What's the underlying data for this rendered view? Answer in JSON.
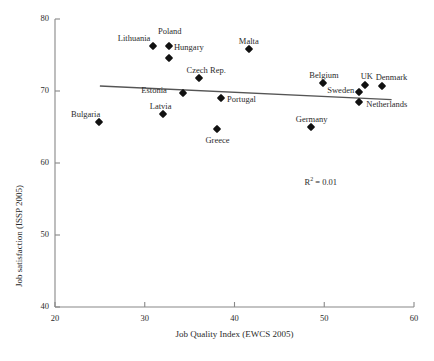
{
  "chart_data": {
    "type": "scatter",
    "title": "",
    "xlabel": "Job Quality Index (EWCS 2005)",
    "ylabel": "Job satisfaction (ISSP 2005)",
    "xlim": [
      20,
      60
    ],
    "ylim": [
      40,
      80
    ],
    "xticks": [
      20,
      30,
      40,
      50,
      60
    ],
    "yticks": [
      40,
      50,
      60,
      70,
      80
    ],
    "grid": false,
    "legend": null,
    "annotations": [
      {
        "name": "r-squared",
        "text_prefix": "R",
        "text_sup": "2",
        "text_suffix": " = 0.01",
        "x": 47.8,
        "y": 57.3
      }
    ],
    "trendline": {
      "x": [
        25.0,
        57.5
      ],
      "y": [
        70.7,
        68.8
      ],
      "color": "#555555"
    },
    "points": [
      {
        "label": "Bulgaria",
        "x": 24.9,
        "y": 65.7,
        "label_dx": -28,
        "label_dy": -13
      },
      {
        "label": "Lithuania",
        "x": 30.9,
        "y": 76.2,
        "label_dx": -35,
        "label_dy": -13
      },
      {
        "label": "Poland",
        "x": 32.7,
        "y": 76.2,
        "label_dx": -11,
        "label_dy": -20
      },
      {
        "label": "Hungary",
        "x": 32.7,
        "y": 74.6,
        "label_dx": 5,
        "label_dy": -16
      },
      {
        "label": "Latvia",
        "x": 32.0,
        "y": 66.8,
        "label_dx": -13,
        "label_dy": -13
      },
      {
        "label": "Estonia",
        "x": 34.3,
        "y": 69.7,
        "label_dx": -42,
        "label_dy": -8
      },
      {
        "label": "Czech Rep.",
        "x": 36.0,
        "y": 71.8,
        "label_dx": -12,
        "label_dy": -13
      },
      {
        "label": "Portugal",
        "x": 38.5,
        "y": 69.0,
        "label_dx": 6,
        "label_dy": -4
      },
      {
        "label": "Greece",
        "x": 38.1,
        "y": 64.7,
        "label_dx": -12,
        "label_dy": 6
      },
      {
        "label": "Malta",
        "x": 41.6,
        "y": 75.8,
        "label_dx": -10,
        "label_dy": -13
      },
      {
        "label": "Germany",
        "x": 48.5,
        "y": 65.0,
        "label_dx": -15,
        "label_dy": -13
      },
      {
        "label": "Belgium",
        "x": 49.9,
        "y": 71.1,
        "label_dx": -14,
        "label_dy": -13
      },
      {
        "label": "Sweden",
        "x": 53.9,
        "y": 69.9,
        "label_dx": -32,
        "label_dy": -7
      },
      {
        "label": "UK",
        "x": 54.5,
        "y": 70.9,
        "label_dx": -4,
        "label_dy": -14
      },
      {
        "label": "Netherlands",
        "x": 53.9,
        "y": 68.5,
        "label_dx": 7,
        "label_dy": -3
      },
      {
        "label": "Denmark",
        "x": 56.4,
        "y": 70.7,
        "label_dx": -6,
        "label_dy": -14
      }
    ]
  }
}
